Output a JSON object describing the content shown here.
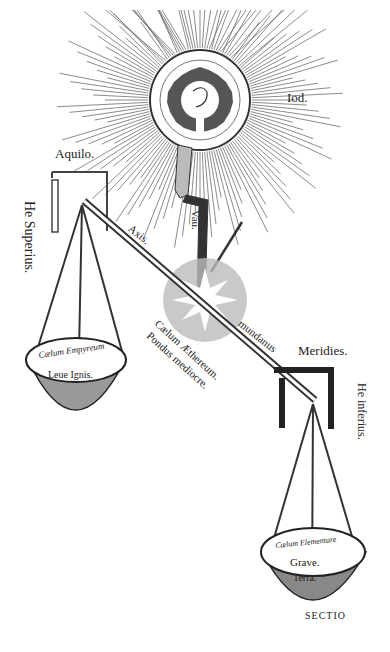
{
  "figure": {
    "labels": {
      "iod": "Iod.",
      "aquilo": "Aquilo.",
      "he_superius": "He Superius.",
      "vau": "Vau.",
      "axis": "Axis.",
      "mundanus": "mundanus",
      "meridies": "Meridies.",
      "he_inferius": "He inferius.",
      "caelum_aethereum": "Cælum Æthereum.",
      "pondus_mediocre": "Pondus mediocre.",
      "left_pan_line1": "Cælum Empyreum",
      "left_pan_line2": "Leue Ignis.",
      "right_pan_line1": "Cælum Elementare",
      "right_pan_line2": "Grave.",
      "right_pan_line3": "Terra.",
      "sectio": "SECTIO"
    },
    "colors": {
      "ink": "#222222",
      "paper": "#ffffff",
      "ray": "#555555"
    }
  }
}
